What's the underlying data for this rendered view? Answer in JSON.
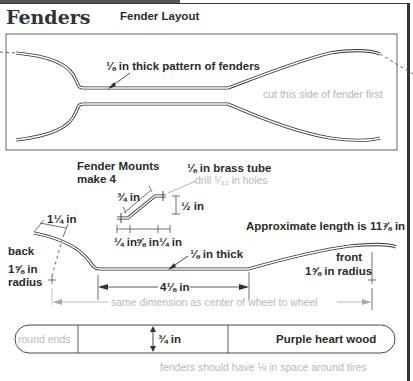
{
  "header": {
    "title": "Fenders",
    "subtitle": "Fender Layout"
  },
  "layout_panel": {
    "pattern_label": "⅛ in thick pattern of fenders",
    "cut_note": "cut this side of fender first"
  },
  "mounts": {
    "title_line1": "Fender Mounts",
    "title_line2": "make 4",
    "tube_label": "⅛ in brass tube",
    "drill_note": "drill ⁵⁄₃₂ in holes",
    "diagonal_dim": "¾ in",
    "height_dim": "½ in",
    "bottom_dims": [
      "¼ in",
      "⅝ in",
      "¼ in"
    ]
  },
  "profile": {
    "lip_dim": "1¼ in",
    "back_label": "back",
    "back_radius_line1": "1⅝ in",
    "back_radius_line2": "radius",
    "thickness_label": "⅛ in thick",
    "approx_length": "Approximate length is 11⅞ in",
    "front_label": "front",
    "front_radius": "1⅝ in radius",
    "flat_dim": "4⅛ in",
    "wheel_note": "same dimension as center of wheel to wheel"
  },
  "stock": {
    "end_note": "round ends",
    "width_dim": "¾ in",
    "material": "Purple heart wood",
    "clearance_note": "fenders should have ⅛ in space around tires"
  },
  "colors": {
    "ink": "#333333",
    "note_grey": "#b5b5b5",
    "frame": "#333333"
  }
}
